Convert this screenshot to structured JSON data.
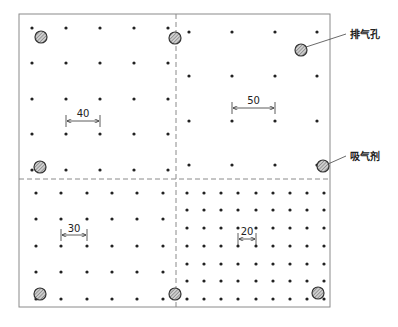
{
  "diagram": {
    "type": "vent-hole-and-getter-layout",
    "frame": {
      "x": 19,
      "y": 14,
      "w": 311,
      "h": 293,
      "stroke": "#8a8a8a"
    },
    "dividers": {
      "vertical_x": 176,
      "horizontal_y": 179,
      "stroke": "#8a8a8a"
    },
    "dot_color": "#222222",
    "quadrants": [
      {
        "name": "top-left",
        "spacing_label": "40",
        "cols": [
          32,
          66,
          100,
          134,
          168
        ],
        "rows": [
          28,
          63,
          99,
          134,
          170
        ],
        "dimension": {
          "x1": 66,
          "x2": 100,
          "y": 121,
          "label_y": 118
        }
      },
      {
        "name": "top-right",
        "spacing_label": "50",
        "cols": [
          189,
          232,
          275,
          317
        ],
        "rows": [
          32,
          76,
          121,
          165
        ],
        "dimension": {
          "x1": 232,
          "x2": 275,
          "y": 108,
          "label_y": 105
        }
      },
      {
        "name": "bottom-left",
        "spacing_label": "30",
        "cols": [
          36,
          61,
          87,
          112,
          137,
          163
        ],
        "rows": [
          193,
          219,
          246,
          272,
          299
        ],
        "dimension": {
          "x1": 61,
          "x2": 87,
          "y": 235,
          "label_y": 233
        }
      },
      {
        "name": "bottom-right",
        "spacing_label": "20",
        "cols": [
          187,
          204,
          221,
          238,
          256,
          273,
          290,
          307,
          324
        ],
        "rows": [
          193,
          210,
          228,
          246,
          264,
          281,
          299
        ],
        "dimension": {
          "x1": 238,
          "x2": 256,
          "y": 239,
          "label_y": 236
        }
      }
    ],
    "holes": [
      {
        "x": 41,
        "y": 37
      },
      {
        "x": 175,
        "y": 38
      },
      {
        "x": 301,
        "y": 50
      },
      {
        "x": 40,
        "y": 167
      },
      {
        "x": 323,
        "y": 166
      },
      {
        "x": 40,
        "y": 294
      },
      {
        "x": 175,
        "y": 294
      },
      {
        "x": 318,
        "y": 293
      }
    ],
    "hole_style": {
      "r": 6,
      "fill": "#bdbdbd",
      "stroke": "#333333"
    },
    "callouts": [
      {
        "label": "排气孔",
        "from": [
          306,
          47
        ],
        "to": [
          346,
          34
        ],
        "text_x": 350,
        "text_y": 38
      },
      {
        "label": "吸气剂",
        "from": [
          328,
          164
        ],
        "to": [
          346,
          156
        ],
        "text_x": 350,
        "text_y": 160
      }
    ]
  }
}
